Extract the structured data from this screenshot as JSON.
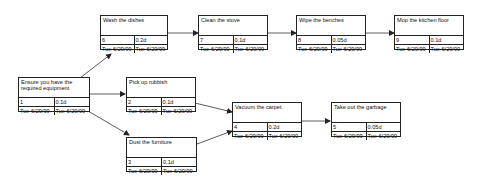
{
  "diagram": {
    "type": "network-diagram",
    "nodes": [
      {
        "id": 1,
        "title": "Ensure you have the required equipment",
        "duration": "0.1d",
        "start": "Tue 6/29/99",
        "finish": "Tue 6/29/99"
      },
      {
        "id": 2,
        "title": "Pick up rubbish",
        "duration": "0.1d",
        "start": "Tue 6/29/99",
        "finish": "Tue 6/29/99"
      },
      {
        "id": 3,
        "title": "Dust the furniture",
        "duration": "0.1d",
        "start": "Tue 6/29/99",
        "finish": "Tue 6/29/99"
      },
      {
        "id": 4,
        "title": "Vacuum the carpet",
        "duration": "0.2d",
        "start": "Tue 6/29/99",
        "finish": "Tue 6/29/99"
      },
      {
        "id": 5,
        "title": "Take out the garbage",
        "duration": "0.05d",
        "start": "Tue 6/29/99",
        "finish": "Tue 6/29/99"
      },
      {
        "id": 6,
        "title": "Wash the dishes",
        "duration": "0.2d",
        "start": "Tue 6/29/99",
        "finish": "Tue 6/29/99"
      },
      {
        "id": 7,
        "title": "Clean the stove",
        "duration": "0.1d",
        "start": "Tue 6/29/99",
        "finish": "Tue 6/29/99"
      },
      {
        "id": 8,
        "title": "Wipe the benches",
        "duration": "0.05d",
        "start": "Tue 6/29/99",
        "finish": "Tue 6/29/99"
      },
      {
        "id": 9,
        "title": "Mop the kitchen floor",
        "duration": "0.1d",
        "start": "Tue 6/29/99",
        "finish": "Tue 6/29/99"
      }
    ],
    "edges": [
      {
        "from": 1,
        "to": 6
      },
      {
        "from": 1,
        "to": 2
      },
      {
        "from": 1,
        "to": 3
      },
      {
        "from": 2,
        "to": 4
      },
      {
        "from": 3,
        "to": 4
      },
      {
        "from": 4,
        "to": 5
      },
      {
        "from": 6,
        "to": 7
      },
      {
        "from": 7,
        "to": 8
      },
      {
        "from": 8,
        "to": 9
      }
    ]
  }
}
